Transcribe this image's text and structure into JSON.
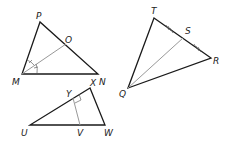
{
  "diagram": {
    "triangles": [
      {
        "name": "MNP",
        "vertices": {
          "P": [
            40,
            22
          ],
          "M": [
            22,
            74
          ],
          "N": [
            98,
            74
          ]
        },
        "segment": {
          "from": "M",
          "to": "O",
          "to_point": [
            66,
            44
          ],
          "type": "angle bisector"
        },
        "labels": {
          "P": "P",
          "M": "M",
          "N": "N",
          "O": "O"
        }
      },
      {
        "name": "QRT",
        "vertices": {
          "T": [
            154,
            18
          ],
          "R": [
            211,
            58
          ],
          "Q": [
            128,
            88
          ]
        },
        "segment": {
          "from": "Q",
          "to": "S",
          "to_point": [
            183,
            38
          ],
          "type": "median"
        },
        "labels": {
          "T": "T",
          "R": "R",
          "Q": "Q",
          "S": "S"
        }
      },
      {
        "name": "UWX",
        "vertices": {
          "X": [
            90,
            88
          ],
          "U": [
            30,
            125
          ],
          "W": [
            105,
            125
          ]
        },
        "segment": {
          "from": "Y",
          "to": "V",
          "from_point": [
            73,
            97
          ],
          "to_point": [
            80,
            125
          ],
          "type": "perpendicular"
        },
        "labels": {
          "X": "X",
          "U": "U",
          "W": "W",
          "Y": "Y",
          "V": "V"
        }
      }
    ],
    "colors": {
      "edge": "#1a1a1a",
      "segment": "#999999"
    }
  }
}
